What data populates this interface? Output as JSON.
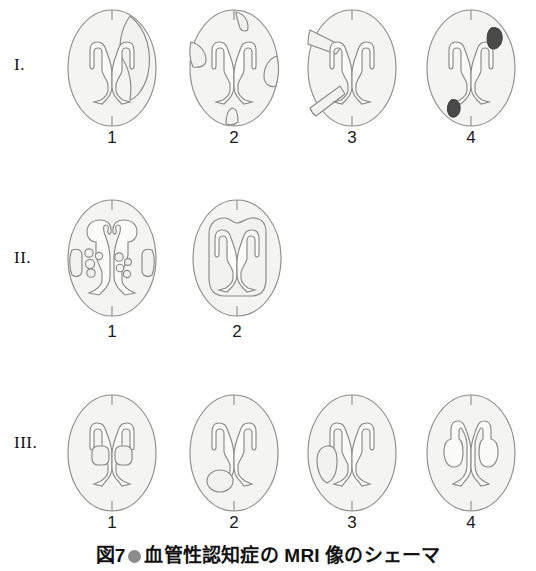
{
  "figure": {
    "caption_prefix": "図7",
    "caption_bullet": "filled-circle-bullet",
    "caption_text": "血管性認知症の MRI 像のシェーマ",
    "caption_full": "図7 ●血管性認知症の MRI 像のシェーマ",
    "background_color": "#ffffff",
    "outline_color": "#8a8a8a",
    "fill_color": "#f4f4f2",
    "dark_lesion_color": "#4a4a4a",
    "bullet_color": "#8c8c8c"
  },
  "rows": [
    {
      "label": "I.",
      "panels": [
        {
          "number": "1",
          "name": "large-territorial-infarct",
          "description": "大梗塞（主幹動脈領域）右側に大きな三日月型病巣"
        },
        {
          "number": "2",
          "name": "multiple-cortical-infarcts",
          "description": "多発皮質梗塞 辺縁に複数の小病巣"
        },
        {
          "number": "3",
          "name": "wedge-shaped-infarcts",
          "description": "楔状（分水嶺）梗塞 左側に二つの楔型病巣"
        },
        {
          "number": "4",
          "name": "hemorrhagic-lesions",
          "description": "出血性病巣 黒い充実性病巣2個"
        }
      ]
    },
    {
      "label": "II.",
      "panels": [
        {
          "number": "1",
          "name": "multiple-lacunar-infarcts",
          "description": "多発ラクナ梗塞 小円形病巣と被殻部卵円形病巣"
        },
        {
          "number": "2",
          "name": "periventricular-leukoaraiosis",
          "description": "びまん性白質病変（ビンスワンガー型）脳室周囲白質の広汎な病変"
        }
      ]
    },
    {
      "label": "III.",
      "panels": [
        {
          "number": "1",
          "name": "bilateral-thalamic-infarcts",
          "description": "両側視床梗塞 左右対称の小病巣"
        },
        {
          "number": "2",
          "name": "single-strategic-infarct-left",
          "description": "左後頭角部の単一戦略的病巣"
        },
        {
          "number": "3",
          "name": "single-lateral-infarct-left",
          "description": "左側脳室外側の半月状病巣"
        },
        {
          "number": "4",
          "name": "enlarged-ventricles",
          "description": "左右対称の脳室拡大"
        }
      ]
    }
  ]
}
